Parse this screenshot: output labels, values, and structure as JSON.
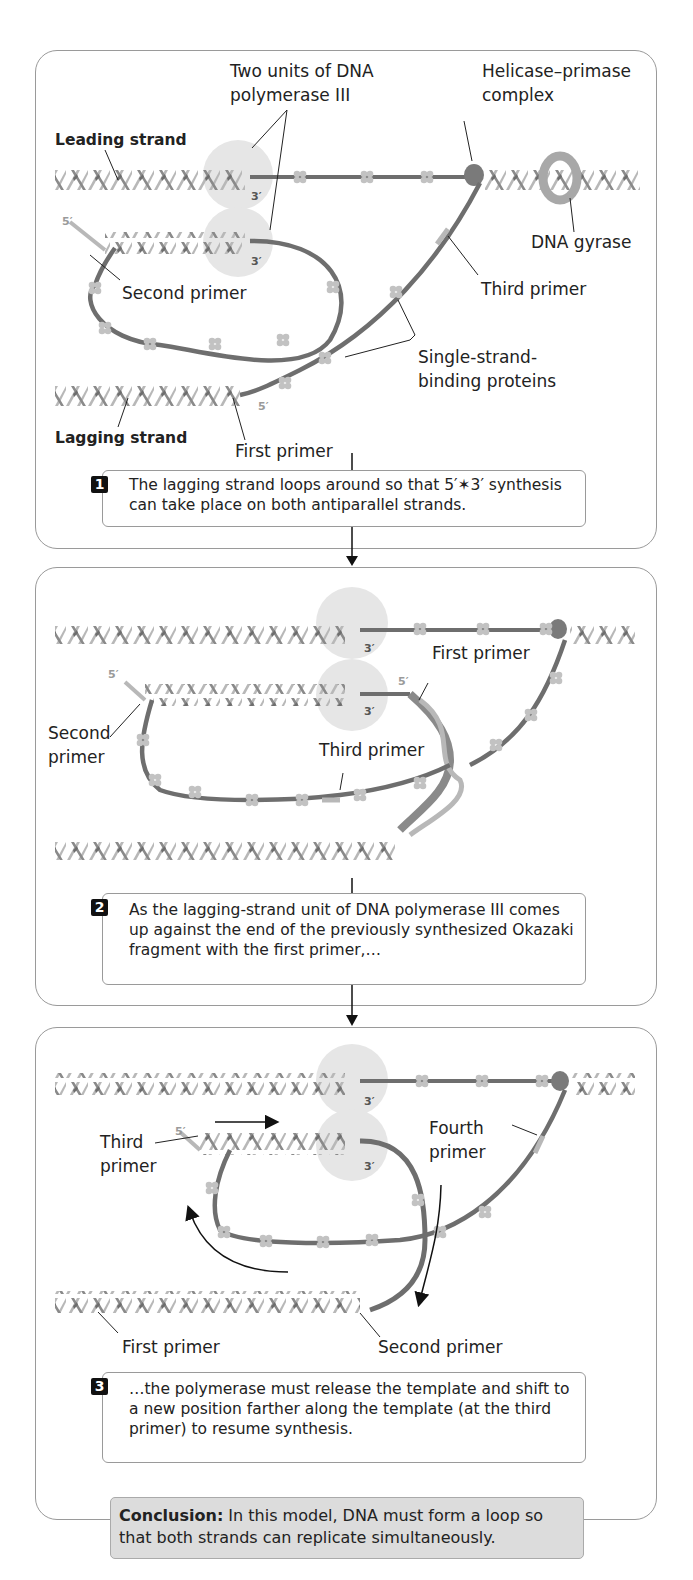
{
  "panel1": {
    "labels": {
      "pol3": "Two units of DNA\npolymerase III",
      "pol3_line1": "Two units of DNA",
      "pol3_line2": "polymerase III",
      "helicase_line1": "Helicase–primase",
      "helicase_line2": "complex",
      "leading": "Leading strand",
      "gyrase": "DNA gyrase",
      "second_primer": "Second primer",
      "third_primer": "Third primer",
      "ssb_line1": "Single-strand-",
      "ssb_line2": "binding proteins",
      "lagging": "Lagging strand",
      "first_primer": "First primer",
      "three_prime_top": "3′",
      "three_prime_bottom": "3′",
      "five_prime_left": "5′",
      "five_prime_lag": "5′"
    },
    "step": {
      "number": "1",
      "text": "The lagging strand loops around so that 5′✶3′ synthesis can take place on both antiparallel strands."
    }
  },
  "panel2": {
    "labels": {
      "first_primer": "First primer",
      "second_line1": "Second",
      "second_line2": "primer",
      "third_primer": "Third primer",
      "three_prime_top": "3′",
      "three_prime_bottom": "3′",
      "five_prime_left": "5′",
      "five_prime_right": "5′"
    },
    "step": {
      "number": "2",
      "text": "As the lagging-strand unit of DNA polymerase III comes up against the end of the previously synthesized Okazaki fragment with the first primer,…"
    }
  },
  "panel3": {
    "labels": {
      "third_line1": "Third",
      "third_line2": "primer",
      "fourth_line1": "Fourth",
      "fourth_line2": "primer",
      "first_primer": "First primer",
      "second_primer": "Second primer",
      "three_prime_top": "3′",
      "three_prime_bottom": "3′",
      "five_prime_left": "5′"
    },
    "step": {
      "number": "3",
      "text": "…the polymerase must release the template and shift to a new position farther along the template (at the third primer) to resume synthesis."
    }
  },
  "conclusion": {
    "label": "Conclusion:",
    "text": " In this model, DNA must form a loop so that both strands can replicate simultaneously."
  },
  "colors": {
    "strand_dark": "#6e6e6e",
    "strand_light": "#b8b8b8",
    "polymerase": "#e6e6e6",
    "helicase": "#7a7a7a",
    "gyrase": "#a8a8a8",
    "conclusion_bg": "#dcdcdc",
    "panel_border": "#9a9a9a"
  }
}
